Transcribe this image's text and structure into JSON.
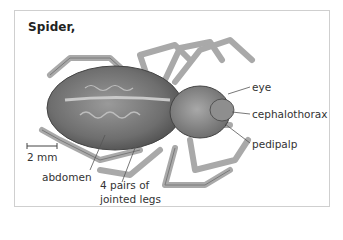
{
  "figure": {
    "title": "Spider,",
    "scale_bar": {
      "label": "2 mm"
    },
    "labels": [
      {
        "id": "eye",
        "text": "eye"
      },
      {
        "id": "cephalothorax",
        "text": "cephalothorax"
      },
      {
        "id": "pedipalp",
        "text": "pedipalp"
      },
      {
        "id": "abdomen",
        "text": "abdomen"
      },
      {
        "id": "legs",
        "line1": "4 pairs of",
        "line2": "jointed legs"
      }
    ],
    "colors": {
      "border": "#cfcfcf",
      "text": "#333333",
      "body_dark": "#5a5a5a",
      "body_mid": "#8a8a8a",
      "leg": "#b8b8b8"
    }
  }
}
